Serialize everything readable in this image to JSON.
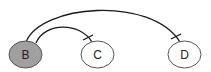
{
  "diagram": {
    "nodes": [
      {
        "id": "B",
        "label": "B",
        "cx": 25.5,
        "cy": 54.5,
        "rx": 16.5,
        "ry": 13.5,
        "fill": "#a0a0a0"
      },
      {
        "id": "C",
        "label": "C",
        "cx": 97.5,
        "cy": 54.5,
        "rx": 16.5,
        "ry": 13.5,
        "fill": "#ffffff"
      },
      {
        "id": "D",
        "label": "D",
        "cx": 184.5,
        "cy": 54.5,
        "rx": 16.5,
        "ry": 13.5,
        "fill": "#ffffff"
      }
    ],
    "edges": [
      {
        "from": "B",
        "to": "C",
        "end_marker": "tick"
      },
      {
        "from": "B",
        "to": "D",
        "end_marker": "tick"
      }
    ],
    "colors": {
      "stroke": "#1a1a1a",
      "node_stroke": "#555555"
    }
  }
}
